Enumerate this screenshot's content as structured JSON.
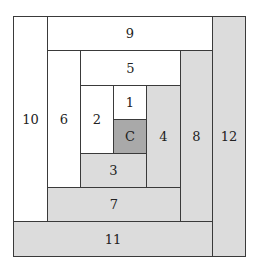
{
  "diagram": {
    "type": "log-cabin-quilt-block",
    "colors": {
      "white": "#ffffff",
      "light": "#dcdcdc",
      "dark": "#a9a9a9",
      "border": "#3a3a3a"
    },
    "pieces": [
      {
        "label": "C",
        "shade": "dark"
      },
      {
        "label": "1",
        "shade": "white"
      },
      {
        "label": "2",
        "shade": "white"
      },
      {
        "label": "3",
        "shade": "light"
      },
      {
        "label": "4",
        "shade": "light"
      },
      {
        "label": "5",
        "shade": "white"
      },
      {
        "label": "6",
        "shade": "white"
      },
      {
        "label": "7",
        "shade": "light"
      },
      {
        "label": "8",
        "shade": "light"
      },
      {
        "label": "9",
        "shade": "white"
      },
      {
        "label": "10",
        "shade": "white"
      },
      {
        "label": "11",
        "shade": "light"
      },
      {
        "label": "12",
        "shade": "light"
      }
    ]
  }
}
